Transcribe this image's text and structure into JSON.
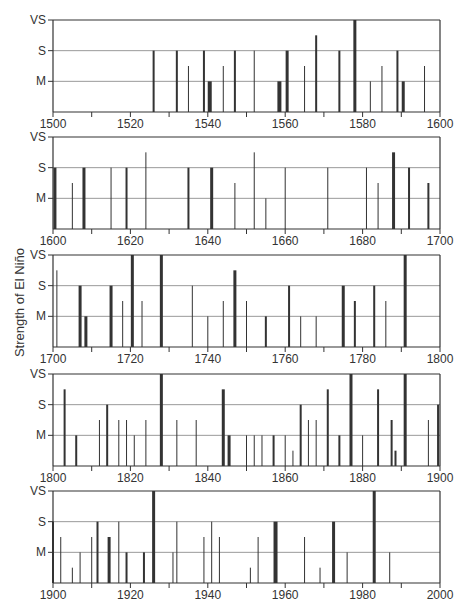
{
  "chart_data": {
    "type": "bar",
    "title": "",
    "ylabel": "Strength of El Niño",
    "xlabel": "",
    "strength_levels": [
      "M",
      "S",
      "VS"
    ],
    "strength_scale_note": "1 = M (moderate), 1.5 = M+ (moderate-strong), 2 = S (strong), 2.5 = S+ (strong-very strong), 3 = VS (very strong); 0.5 = weak",
    "colors": {
      "bar": "#333333",
      "grid": "#999999",
      "axis": "#333333"
    },
    "panels": [
      {
        "xlim": [
          1500,
          1600
        ],
        "xticks": [
          "1500",
          "1520",
          "1540",
          "1560",
          "1580",
          "1600"
        ],
        "events": [
          {
            "year": 1526,
            "strength": 2,
            "w": 2
          },
          {
            "year": 1532,
            "strength": 2,
            "w": 2
          },
          {
            "year": 1535,
            "strength": 1.5,
            "w": 1
          },
          {
            "year": 1539,
            "strength": 2,
            "w": 2
          },
          {
            "year": 1540.5,
            "strength": 1,
            "w": 4
          },
          {
            "year": 1544,
            "strength": 1.5,
            "w": 1
          },
          {
            "year": 1547,
            "strength": 2,
            "w": 2
          },
          {
            "year": 1552,
            "strength": 2,
            "w": 1
          },
          {
            "year": 1558.5,
            "strength": 1,
            "w": 4
          },
          {
            "year": 1560.5,
            "strength": 2,
            "w": 3
          },
          {
            "year": 1565,
            "strength": 1.5,
            "w": 1
          },
          {
            "year": 1568,
            "strength": 2.5,
            "w": 2
          },
          {
            "year": 1574,
            "strength": 2,
            "w": 2
          },
          {
            "year": 1578,
            "strength": 3,
            "w": 3
          },
          {
            "year": 1582,
            "strength": 1,
            "w": 1
          },
          {
            "year": 1585,
            "strength": 1.5,
            "w": 1
          },
          {
            "year": 1589,
            "strength": 2,
            "w": 2
          },
          {
            "year": 1590.5,
            "strength": 1,
            "w": 3
          },
          {
            "year": 1596,
            "strength": 1.5,
            "w": 1
          }
        ]
      },
      {
        "xlim": [
          1600,
          1700
        ],
        "xticks": [
          "1600",
          "1620",
          "1640",
          "1660",
          "1680",
          "1700"
        ],
        "events": [
          {
            "year": 1600.5,
            "strength": 2,
            "w": 3
          },
          {
            "year": 1605,
            "strength": 1.5,
            "w": 1
          },
          {
            "year": 1608,
            "strength": 2,
            "w": 3
          },
          {
            "year": 1615,
            "strength": 2,
            "w": 1
          },
          {
            "year": 1619,
            "strength": 2,
            "w": 2
          },
          {
            "year": 1624,
            "strength": 2.5,
            "w": 1
          },
          {
            "year": 1635,
            "strength": 2,
            "w": 2
          },
          {
            "year": 1641,
            "strength": 2,
            "w": 3
          },
          {
            "year": 1647,
            "strength": 1.5,
            "w": 1
          },
          {
            "year": 1652,
            "strength": 2.5,
            "w": 1
          },
          {
            "year": 1655,
            "strength": 1,
            "w": 1
          },
          {
            "year": 1660,
            "strength": 2,
            "w": 1
          },
          {
            "year": 1671,
            "strength": 2,
            "w": 1
          },
          {
            "year": 1681,
            "strength": 2,
            "w": 1
          },
          {
            "year": 1684,
            "strength": 1.5,
            "w": 1
          },
          {
            "year": 1688,
            "strength": 2.5,
            "w": 3
          },
          {
            "year": 1692,
            "strength": 2,
            "w": 2
          },
          {
            "year": 1697,
            "strength": 1.5,
            "w": 2
          }
        ]
      },
      {
        "xlim": [
          1700,
          1800
        ],
        "xticks": [
          "1700",
          "1720",
          "1740",
          "1760",
          "1780",
          "1800"
        ],
        "events": [
          {
            "year": 1701,
            "strength": 2.5,
            "w": 1
          },
          {
            "year": 1707,
            "strength": 2,
            "w": 3
          },
          {
            "year": 1708.5,
            "strength": 1,
            "w": 3
          },
          {
            "year": 1715,
            "strength": 2,
            "w": 3
          },
          {
            "year": 1718,
            "strength": 1.5,
            "w": 1
          },
          {
            "year": 1720.5,
            "strength": 3,
            "w": 3
          },
          {
            "year": 1723,
            "strength": 1.5,
            "w": 1
          },
          {
            "year": 1728,
            "strength": 3,
            "w": 3
          },
          {
            "year": 1736,
            "strength": 2,
            "w": 1
          },
          {
            "year": 1740,
            "strength": 1,
            "w": 1
          },
          {
            "year": 1744,
            "strength": 1.5,
            "w": 1
          },
          {
            "year": 1747,
            "strength": 2.5,
            "w": 3
          },
          {
            "year": 1750,
            "strength": 1.5,
            "w": 1
          },
          {
            "year": 1755,
            "strength": 1,
            "w": 2
          },
          {
            "year": 1761,
            "strength": 2,
            "w": 2
          },
          {
            "year": 1764,
            "strength": 1,
            "w": 1
          },
          {
            "year": 1768,
            "strength": 1,
            "w": 1
          },
          {
            "year": 1775,
            "strength": 2,
            "w": 3
          },
          {
            "year": 1778,
            "strength": 1.5,
            "w": 2
          },
          {
            "year": 1783,
            "strength": 2,
            "w": 2
          },
          {
            "year": 1786,
            "strength": 1.5,
            "w": 1
          },
          {
            "year": 1791,
            "strength": 3,
            "w": 3
          }
        ]
      },
      {
        "xlim": [
          1800,
          1900
        ],
        "xticks": [
          "1800",
          "1820",
          "1840",
          "1860",
          "1880",
          "1900"
        ],
        "events": [
          {
            "year": 1803,
            "strength": 2.5,
            "w": 2
          },
          {
            "year": 1806,
            "strength": 1,
            "w": 2
          },
          {
            "year": 1812,
            "strength": 1.5,
            "w": 1
          },
          {
            "year": 1814,
            "strength": 2,
            "w": 2
          },
          {
            "year": 1817,
            "strength": 1.5,
            "w": 1
          },
          {
            "year": 1819,
            "strength": 1.5,
            "w": 1
          },
          {
            "year": 1821,
            "strength": 1,
            "w": 1
          },
          {
            "year": 1824,
            "strength": 1.5,
            "w": 1
          },
          {
            "year": 1828,
            "strength": 3,
            "w": 3
          },
          {
            "year": 1832,
            "strength": 1.5,
            "w": 1
          },
          {
            "year": 1837,
            "strength": 1.5,
            "w": 1
          },
          {
            "year": 1844,
            "strength": 2.5,
            "w": 3
          },
          {
            "year": 1845.5,
            "strength": 1,
            "w": 3
          },
          {
            "year": 1850,
            "strength": 1,
            "w": 1
          },
          {
            "year": 1852,
            "strength": 1,
            "w": 1
          },
          {
            "year": 1854,
            "strength": 1,
            "w": 1
          },
          {
            "year": 1857,
            "strength": 1,
            "w": 2
          },
          {
            "year": 1860,
            "strength": 1,
            "w": 1
          },
          {
            "year": 1862,
            "strength": 0.5,
            "w": 1
          },
          {
            "year": 1864,
            "strength": 2,
            "w": 2
          },
          {
            "year": 1866,
            "strength": 1.5,
            "w": 1
          },
          {
            "year": 1868,
            "strength": 1.5,
            "w": 1
          },
          {
            "year": 1871,
            "strength": 2.5,
            "w": 2
          },
          {
            "year": 1874,
            "strength": 1,
            "w": 2
          },
          {
            "year": 1877,
            "strength": 3,
            "w": 3
          },
          {
            "year": 1880,
            "strength": 1,
            "w": 1
          },
          {
            "year": 1884,
            "strength": 2.5,
            "w": 2
          },
          {
            "year": 1887.5,
            "strength": 1.5,
            "w": 2
          },
          {
            "year": 1888.5,
            "strength": 0.5,
            "w": 2
          },
          {
            "year": 1891,
            "strength": 3,
            "w": 3
          },
          {
            "year": 1897,
            "strength": 1.5,
            "w": 1
          },
          {
            "year": 1899.5,
            "strength": 2,
            "w": 2
          }
        ]
      },
      {
        "xlim": [
          1900,
          2000
        ],
        "xticks": [
          "1900",
          "1920",
          "1940",
          "1960",
          "1980",
          "2000"
        ],
        "events": [
          {
            "year": 1900,
            "strength": 2,
            "w": 2
          },
          {
            "year": 1902,
            "strength": 1.5,
            "w": 1
          },
          {
            "year": 1905,
            "strength": 0.5,
            "w": 1
          },
          {
            "year": 1907,
            "strength": 1,
            "w": 1
          },
          {
            "year": 1910,
            "strength": 1.5,
            "w": 1
          },
          {
            "year": 1911.5,
            "strength": 2,
            "w": 2
          },
          {
            "year": 1914.5,
            "strength": 1.5,
            "w": 3
          },
          {
            "year": 1917,
            "strength": 2,
            "w": 1
          },
          {
            "year": 1919,
            "strength": 1,
            "w": 2
          },
          {
            "year": 1923.5,
            "strength": 1,
            "w": 2
          },
          {
            "year": 1926,
            "strength": 3,
            "w": 3
          },
          {
            "year": 1931,
            "strength": 1,
            "w": 1
          },
          {
            "year": 1932,
            "strength": 2,
            "w": 1
          },
          {
            "year": 1939,
            "strength": 1.5,
            "w": 1
          },
          {
            "year": 1941,
            "strength": 2,
            "w": 1
          },
          {
            "year": 1943,
            "strength": 1.5,
            "w": 1
          },
          {
            "year": 1951,
            "strength": 0.5,
            "w": 1
          },
          {
            "year": 1953,
            "strength": 1.5,
            "w": 1
          },
          {
            "year": 1957.5,
            "strength": 2,
            "w": 4
          },
          {
            "year": 1965,
            "strength": 1.5,
            "w": 1
          },
          {
            "year": 1969,
            "strength": 0.5,
            "w": 1
          },
          {
            "year": 1972.5,
            "strength": 2,
            "w": 3
          },
          {
            "year": 1976,
            "strength": 1,
            "w": 1
          },
          {
            "year": 1983,
            "strength": 3,
            "w": 3
          },
          {
            "year": 1987,
            "strength": 1,
            "w": 1
          }
        ]
      }
    ]
  },
  "layout": {
    "plot_left": 53,
    "plot_right": 440,
    "panel_tops": [
      20,
      137,
      255,
      374,
      491
    ],
    "panel_height": 92
  }
}
